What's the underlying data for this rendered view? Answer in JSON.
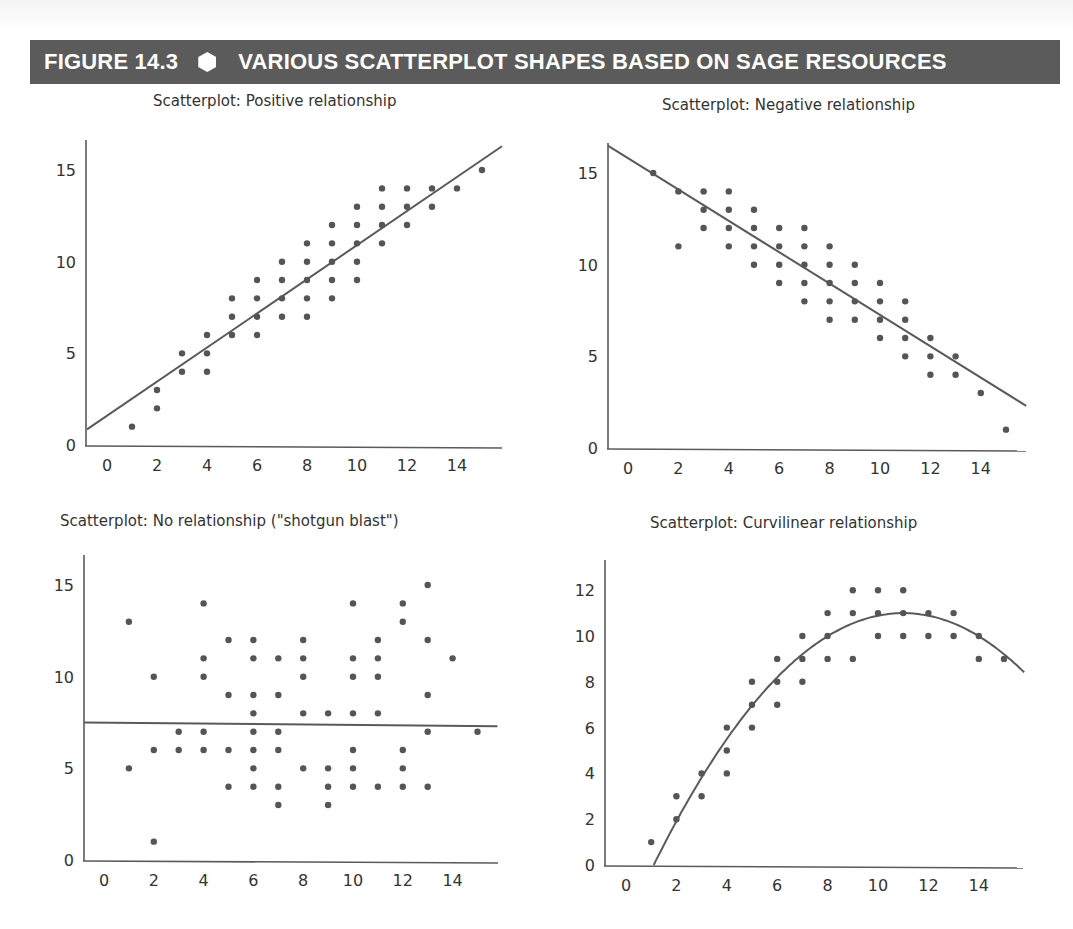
{
  "figure": {
    "number": "FIGURE 14.3",
    "title": "VARIOUS SCATTERPLOT SHAPES BASED ON SAGE RESOURCES",
    "marker_icon": "hexagon-icon",
    "banner_color": "#5b5b5b"
  },
  "chart_data": [
    {
      "type": "scatter",
      "title": "Scatterplot: Positive relationship",
      "xlabel": "",
      "ylabel": "",
      "xticks": [
        0,
        2,
        4,
        6,
        8,
        10,
        12,
        14
      ],
      "yticks": [
        0,
        5,
        10,
        15
      ],
      "xlim": [
        -0.8,
        15.8
      ],
      "ylim": [
        0,
        16.5
      ],
      "grid": false,
      "points": [
        [
          1,
          1
        ],
        [
          2,
          2
        ],
        [
          2,
          3
        ],
        [
          3,
          4
        ],
        [
          3,
          5
        ],
        [
          4,
          4
        ],
        [
          4,
          5
        ],
        [
          4,
          6
        ],
        [
          5,
          6
        ],
        [
          5,
          7
        ],
        [
          5,
          8
        ],
        [
          6,
          6
        ],
        [
          6,
          7
        ],
        [
          6,
          8
        ],
        [
          6,
          9
        ],
        [
          7,
          7
        ],
        [
          7,
          8
        ],
        [
          7,
          9
        ],
        [
          7,
          10
        ],
        [
          8,
          7
        ],
        [
          8,
          8
        ],
        [
          8,
          9
        ],
        [
          8,
          10
        ],
        [
          8,
          11
        ],
        [
          9,
          8
        ],
        [
          9,
          9
        ],
        [
          9,
          10
        ],
        [
          9,
          11
        ],
        [
          9,
          12
        ],
        [
          10,
          9
        ],
        [
          10,
          10
        ],
        [
          10,
          11
        ],
        [
          10,
          12
        ],
        [
          10,
          13
        ],
        [
          11,
          11
        ],
        [
          11,
          12
        ],
        [
          11,
          13
        ],
        [
          11,
          14
        ],
        [
          12,
          12
        ],
        [
          12,
          13
        ],
        [
          12,
          14
        ],
        [
          13,
          13
        ],
        [
          13,
          14
        ],
        [
          14,
          14
        ],
        [
          15,
          15
        ]
      ],
      "fit_line": {
        "type": "linear",
        "from": [
          -0.8,
          0.85
        ],
        "to": [
          15.8,
          16.3
        ]
      }
    },
    {
      "type": "scatter",
      "title": "Scatterplot: Negative relationship",
      "xlabel": "",
      "ylabel": "",
      "xticks": [
        0,
        2,
        4,
        6,
        8,
        10,
        12,
        14
      ],
      "yticks": [
        0,
        5,
        10,
        15
      ],
      "xlim": [
        -0.8,
        15.8
      ],
      "ylim": [
        0,
        16.5
      ],
      "grid": false,
      "points": [
        [
          1,
          15
        ],
        [
          2,
          14
        ],
        [
          2,
          11
        ],
        [
          3,
          14
        ],
        [
          3,
          13
        ],
        [
          3,
          12
        ],
        [
          4,
          14
        ],
        [
          4,
          13
        ],
        [
          4,
          12
        ],
        [
          4,
          11
        ],
        [
          5,
          13
        ],
        [
          5,
          12
        ],
        [
          5,
          11
        ],
        [
          5,
          10
        ],
        [
          6,
          12
        ],
        [
          6,
          11
        ],
        [
          6,
          10
        ],
        [
          6,
          9
        ],
        [
          7,
          12
        ],
        [
          7,
          11
        ],
        [
          7,
          10
        ],
        [
          7,
          9
        ],
        [
          7,
          8
        ],
        [
          8,
          11
        ],
        [
          8,
          10
        ],
        [
          8,
          9
        ],
        [
          8,
          8
        ],
        [
          8,
          7
        ],
        [
          9,
          10
        ],
        [
          9,
          9
        ],
        [
          9,
          8
        ],
        [
          9,
          7
        ],
        [
          10,
          9
        ],
        [
          10,
          8
        ],
        [
          10,
          7
        ],
        [
          10,
          6
        ],
        [
          11,
          8
        ],
        [
          11,
          7
        ],
        [
          11,
          6
        ],
        [
          11,
          5
        ],
        [
          12,
          6
        ],
        [
          12,
          5
        ],
        [
          12,
          4
        ],
        [
          13,
          5
        ],
        [
          13,
          4
        ],
        [
          14,
          3
        ],
        [
          15,
          1
        ]
      ],
      "fit_line": {
        "type": "linear",
        "from": [
          -0.8,
          16.5
        ],
        "to": [
          15.8,
          2.3
        ]
      }
    },
    {
      "type": "scatter",
      "title": "Scatterplot: No relationship (\"shotgun blast\")",
      "xlabel": "",
      "ylabel": "",
      "xticks": [
        0,
        2,
        4,
        6,
        8,
        10,
        12,
        14
      ],
      "yticks": [
        0,
        5,
        10,
        15
      ],
      "xlim": [
        -0.8,
        15.8
      ],
      "ylim": [
        0,
        16.5
      ],
      "grid": false,
      "points": [
        [
          1,
          13
        ],
        [
          1,
          5
        ],
        [
          2,
          10
        ],
        [
          2,
          6
        ],
        [
          2,
          1
        ],
        [
          3,
          7
        ],
        [
          3,
          6
        ],
        [
          4,
          14
        ],
        [
          4,
          11
        ],
        [
          4,
          10
        ],
        [
          4,
          7
        ],
        [
          4,
          6
        ],
        [
          5,
          12
        ],
        [
          5,
          9
        ],
        [
          5,
          6
        ],
        [
          5,
          4
        ],
        [
          6,
          12
        ],
        [
          6,
          11
        ],
        [
          6,
          9
        ],
        [
          6,
          8
        ],
        [
          6,
          7
        ],
        [
          6,
          6
        ],
        [
          6,
          5
        ],
        [
          6,
          4
        ],
        [
          7,
          11
        ],
        [
          7,
          9
        ],
        [
          7,
          7
        ],
        [
          7,
          6
        ],
        [
          7,
          4
        ],
        [
          7,
          3
        ],
        [
          8,
          12
        ],
        [
          8,
          11
        ],
        [
          8,
          10
        ],
        [
          8,
          8
        ],
        [
          8,
          5
        ],
        [
          9,
          8
        ],
        [
          9,
          5
        ],
        [
          9,
          4
        ],
        [
          9,
          3
        ],
        [
          10,
          14
        ],
        [
          10,
          11
        ],
        [
          10,
          10
        ],
        [
          10,
          8
        ],
        [
          10,
          6
        ],
        [
          10,
          5
        ],
        [
          10,
          4
        ],
        [
          11,
          12
        ],
        [
          11,
          11
        ],
        [
          11,
          10
        ],
        [
          11,
          8
        ],
        [
          11,
          4
        ],
        [
          12,
          14
        ],
        [
          12,
          13
        ],
        [
          12,
          6
        ],
        [
          12,
          5
        ],
        [
          12,
          4
        ],
        [
          13,
          15
        ],
        [
          13,
          12
        ],
        [
          13,
          9
        ],
        [
          13,
          7
        ],
        [
          13,
          4
        ],
        [
          14,
          11
        ],
        [
          15,
          7
        ]
      ],
      "fit_line": {
        "type": "linear",
        "from": [
          -0.8,
          7.5
        ],
        "to": [
          15.8,
          7.3
        ]
      }
    },
    {
      "type": "scatter",
      "title": "Scatterplot: Curvilinear relationship",
      "xlabel": "",
      "ylabel": "",
      "xticks": [
        0,
        2,
        4,
        6,
        8,
        10,
        12,
        14
      ],
      "yticks": [
        0,
        2,
        4,
        6,
        8,
        10,
        12
      ],
      "xlim": [
        -0.8,
        15.8
      ],
      "ylim": [
        0,
        13.2
      ],
      "grid": false,
      "points": [
        [
          1,
          1
        ],
        [
          2,
          3
        ],
        [
          2,
          2
        ],
        [
          3,
          4
        ],
        [
          3,
          3
        ],
        [
          4,
          6
        ],
        [
          4,
          5
        ],
        [
          4,
          4
        ],
        [
          5,
          8
        ],
        [
          5,
          7
        ],
        [
          5,
          6
        ],
        [
          6,
          9
        ],
        [
          6,
          8
        ],
        [
          6,
          7
        ],
        [
          7,
          10
        ],
        [
          7,
          9
        ],
        [
          7,
          8
        ],
        [
          8,
          11
        ],
        [
          8,
          10
        ],
        [
          8,
          9
        ],
        [
          9,
          12
        ],
        [
          9,
          11
        ],
        [
          9,
          9
        ],
        [
          10,
          12
        ],
        [
          10,
          11
        ],
        [
          10,
          10
        ],
        [
          11,
          12
        ],
        [
          11,
          11
        ],
        [
          11,
          10
        ],
        [
          12,
          11
        ],
        [
          12,
          10
        ],
        [
          13,
          11
        ],
        [
          13,
          10
        ],
        [
          14,
          10
        ],
        [
          14,
          9
        ],
        [
          15,
          9
        ]
      ],
      "fit_line": {
        "type": "quadratic",
        "vertex": [
          11,
          11
        ],
        "x_intercept": 1.1,
        "to": [
          15.8,
          8.0
        ]
      }
    }
  ]
}
